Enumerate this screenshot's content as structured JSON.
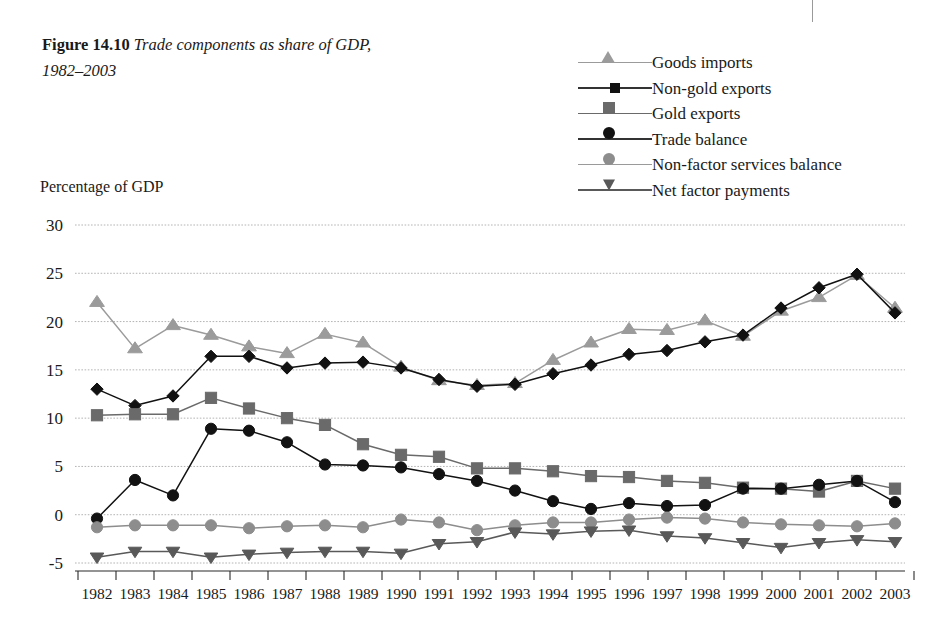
{
  "figure": {
    "number_label": "Figure 14.10",
    "title": "Trade components as share of GDP,",
    "title_line2": "1982–2003"
  },
  "axis": {
    "y_axis_label": "Percentage of GDP",
    "y_ticks": [
      "30",
      "25",
      "20",
      "15",
      "10",
      "5",
      "0",
      "-5"
    ],
    "x_ticks": [
      "1982",
      "1983",
      "1984",
      "1985",
      "1986",
      "1987",
      "1988",
      "1989",
      "1990",
      "1991",
      "1992",
      "1993",
      "1994",
      "1995",
      "1996",
      "1997",
      "1998",
      "1999",
      "2000",
      "2001",
      "2002",
      "2003"
    ]
  },
  "legend": {
    "items": [
      {
        "label": "Goods imports",
        "marker": "triangle-up-icon",
        "color": "#9b9b9b"
      },
      {
        "label": "Non-gold exports",
        "marker": "diamond-icon",
        "color": "#111111"
      },
      {
        "label": "Gold exports",
        "marker": "square-icon",
        "color": "#6a6a6a"
      },
      {
        "label": "Trade balance",
        "marker": "circle-icon",
        "color": "#121212"
      },
      {
        "label": "Non-factor services balance",
        "marker": "circle-gray-icon",
        "color": "#8d8d8d"
      },
      {
        "label": "Net factor payments",
        "marker": "triangle-down-icon",
        "color": "#595959"
      }
    ]
  },
  "chart_data": {
    "type": "line",
    "title": "Trade components as share of GDP, 1982–2003",
    "xlabel": "",
    "ylabel": "Percentage of GDP",
    "ylim": [
      -5,
      30
    ],
    "ytick_step": 5,
    "grid": true,
    "legend_position": "top-right",
    "x": [
      1982,
      1983,
      1984,
      1985,
      1986,
      1987,
      1988,
      1989,
      1990,
      1991,
      1992,
      1993,
      1994,
      1995,
      1996,
      1997,
      1998,
      1999,
      2000,
      2001,
      2002,
      2003
    ],
    "series": [
      {
        "name": "Goods imports",
        "color": "#9b9b9b",
        "marker": "triangle-up",
        "values": [
          22.0,
          17.2,
          19.6,
          18.6,
          17.4,
          16.7,
          18.7,
          17.8,
          15.3,
          13.9,
          13.4,
          13.6,
          16.0,
          17.8,
          19.2,
          19.1,
          20.1,
          18.5,
          21.1,
          22.5,
          24.8,
          21.4
        ]
      },
      {
        "name": "Non-gold exports",
        "color": "#111111",
        "marker": "diamond",
        "values": [
          13.0,
          11.3,
          12.3,
          16.4,
          16.4,
          15.2,
          15.7,
          15.8,
          15.2,
          14.0,
          13.3,
          13.5,
          14.6,
          15.5,
          16.6,
          17.0,
          17.9,
          18.6,
          21.4,
          23.5,
          24.9,
          20.9
        ]
      },
      {
        "name": "Gold exports",
        "color": "#6a6a6a",
        "marker": "square",
        "values": [
          10.3,
          10.4,
          10.4,
          12.1,
          11.0,
          10.0,
          9.3,
          7.3,
          6.2,
          6.0,
          4.8,
          4.8,
          4.5,
          4.0,
          3.9,
          3.5,
          3.3,
          2.8,
          2.7,
          2.4,
          3.5,
          2.7
        ]
      },
      {
        "name": "Trade balance",
        "color": "#121212",
        "marker": "circle",
        "values": [
          -0.4,
          3.6,
          2.0,
          8.9,
          8.7,
          7.5,
          5.2,
          5.1,
          4.9,
          4.2,
          3.5,
          2.5,
          1.4,
          0.6,
          1.2,
          0.9,
          1.0,
          2.7,
          2.7,
          3.1,
          3.5,
          1.3
        ]
      },
      {
        "name": "Non-factor services balance",
        "color": "#8d8d8d",
        "marker": "circle",
        "values": [
          -1.3,
          -1.1,
          -1.1,
          -1.1,
          -1.4,
          -1.2,
          -1.1,
          -1.3,
          -0.5,
          -0.8,
          -1.6,
          -1.1,
          -0.8,
          -0.8,
          -0.5,
          -0.3,
          -0.4,
          -0.8,
          -1.0,
          -1.1,
          -1.2,
          -0.9
        ]
      },
      {
        "name": "Net factor payments",
        "color": "#595959",
        "marker": "triangle-down",
        "values": [
          -4.4,
          -3.8,
          -3.8,
          -4.4,
          -4.1,
          -3.9,
          -3.8,
          -3.8,
          -4.0,
          -3.0,
          -2.8,
          -1.8,
          -2.0,
          -1.7,
          -1.6,
          -2.2,
          -2.4,
          -2.9,
          -3.4,
          -2.9,
          -2.6,
          -2.8
        ]
      }
    ]
  }
}
